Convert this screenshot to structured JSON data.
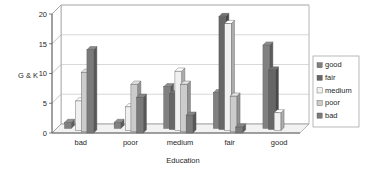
{
  "chart_data": {
    "type": "bar",
    "title": "",
    "subtitle": "",
    "xlabel": "Education",
    "ylabel": "G & K",
    "categories": [
      "bad",
      "poor",
      "medium",
      "fair",
      "good"
    ],
    "series": [
      {
        "name": "good",
        "color": "#808080",
        "values": [
          1,
          1,
          7,
          6,
          14
        ]
      },
      {
        "name": "fair",
        "color": "#666666",
        "values": [
          0,
          0,
          6,
          19,
          10
        ]
      },
      {
        "name": "medium",
        "color": "#f0f0f0",
        "values": [
          5,
          4,
          10,
          18,
          3
        ]
      },
      {
        "name": "poor",
        "color": "#cccccc",
        "values": [
          10,
          8,
          8,
          6,
          0
        ]
      },
      {
        "name": "bad",
        "color": "#7a7a7a",
        "values": [
          14,
          6,
          3,
          1,
          0
        ]
      }
    ],
    "ylim": [
      0,
      20
    ],
    "yticks": [
      0,
      5,
      10,
      15,
      20
    ],
    "ytick_labels": [
      "0",
      "5",
      "10",
      "15",
      "20"
    ],
    "grid": true,
    "grid_axis": "y",
    "legend_position": "right",
    "legend_entries": [
      "good",
      "fair",
      "medium",
      "poor",
      "bad"
    ],
    "three_d": true
  },
  "legend": {
    "items": [
      {
        "label": "good"
      },
      {
        "label": "fair"
      },
      {
        "label": "medium"
      },
      {
        "label": "poor"
      },
      {
        "label": "bad"
      }
    ]
  },
  "axes": {
    "y_title": "G & K",
    "x_title": "Education"
  }
}
